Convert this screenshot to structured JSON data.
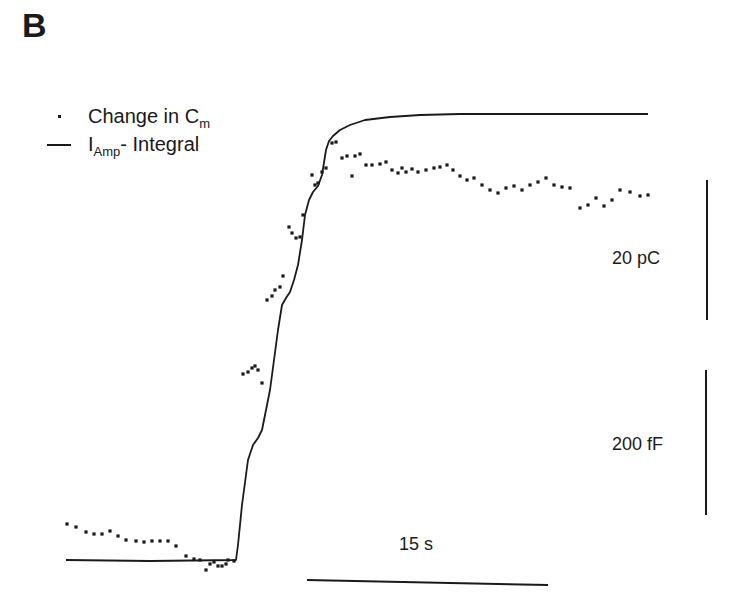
{
  "panel_label": "B",
  "legend": {
    "dots_label_main": "Change in C",
    "dots_label_sub": "m",
    "line_label_main": "I",
    "line_label_sub": "Amp",
    "line_label_rest": "- Integral"
  },
  "scale_bars": {
    "charge": "20 pC",
    "capacitance": "200 fF",
    "time": "15 s"
  },
  "colors": {
    "ink": "#1a1a1a",
    "background": "#ffffff"
  },
  "chart_data": {
    "type": "scatter",
    "title": "",
    "xlabel": "",
    "ylabel": "",
    "grid": false,
    "legend_position": "top-left",
    "annotations": [
      "20 pC (vertical scale bar)",
      "200 fF (vertical scale bar)",
      "15 s (horizontal scale bar)"
    ],
    "series": [
      {
        "name": "I_Amp- Integral",
        "style": "line",
        "pixel_points": [
          [
            66,
            560
          ],
          [
            150,
            561
          ],
          [
            236,
            560
          ],
          [
            238,
            545
          ],
          [
            242,
            505
          ],
          [
            248,
            460
          ],
          [
            253,
            445
          ],
          [
            258,
            438
          ],
          [
            262,
            430
          ],
          [
            266,
            410
          ],
          [
            270,
            390
          ],
          [
            274,
            360
          ],
          [
            278,
            330
          ],
          [
            282,
            305
          ],
          [
            286,
            298
          ],
          [
            290,
            292
          ],
          [
            294,
            280
          ],
          [
            298,
            265
          ],
          [
            302,
            240
          ],
          [
            305,
            215
          ],
          [
            309,
            200
          ],
          [
            313,
            192
          ],
          [
            318,
            186
          ],
          [
            322,
            175
          ],
          [
            326,
            150
          ],
          [
            329,
            141
          ],
          [
            333,
            136
          ],
          [
            340,
            130
          ],
          [
            350,
            125
          ],
          [
            365,
            120
          ],
          [
            390,
            117
          ],
          [
            420,
            115
          ],
          [
            460,
            114
          ],
          [
            648,
            114
          ]
        ]
      },
      {
        "name": "Change in C_m",
        "style": "dots",
        "pixel_points": [
          [
            67,
            524
          ],
          [
            76,
            527
          ],
          [
            86,
            532
          ],
          [
            94,
            534
          ],
          [
            102,
            534
          ],
          [
            110,
            531
          ],
          [
            118,
            536
          ],
          [
            126,
            540
          ],
          [
            136,
            541
          ],
          [
            144,
            542
          ],
          [
            152,
            541
          ],
          [
            160,
            541
          ],
          [
            168,
            541
          ],
          [
            176,
            546
          ],
          [
            186,
            556
          ],
          [
            194,
            559
          ],
          [
            200,
            560
          ],
          [
            206,
            570
          ],
          [
            210,
            564
          ],
          [
            214,
            562
          ],
          [
            218,
            566
          ],
          [
            222,
            566
          ],
          [
            226,
            564
          ],
          [
            228,
            560
          ],
          [
            234,
            561
          ],
          [
            243,
            374
          ],
          [
            248,
            372
          ],
          [
            252,
            368
          ],
          [
            255,
            366
          ],
          [
            258,
            370
          ],
          [
            262,
            383
          ],
          [
            267,
            300
          ],
          [
            272,
            296
          ],
          [
            275,
            290
          ],
          [
            280,
            287
          ],
          [
            283,
            276
          ],
          [
            289,
            227
          ],
          [
            292,
            233
          ],
          [
            296,
            238
          ],
          [
            300,
            237
          ],
          [
            303,
            215
          ],
          [
            312,
            175
          ],
          [
            315,
            185
          ],
          [
            318,
            183
          ],
          [
            322,
            172
          ],
          [
            326,
            168
          ],
          [
            332,
            143
          ],
          [
            336,
            142
          ],
          [
            342,
            158
          ],
          [
            347,
            156
          ],
          [
            352,
            176
          ],
          [
            355,
            156
          ],
          [
            360,
            154
          ],
          [
            366,
            165
          ],
          [
            372,
            165
          ],
          [
            380,
            164
          ],
          [
            386,
            162
          ],
          [
            392,
            170
          ],
          [
            398,
            173
          ],
          [
            402,
            168
          ],
          [
            406,
            172
          ],
          [
            412,
            169
          ],
          [
            418,
            172
          ],
          [
            426,
            170
          ],
          [
            434,
            168
          ],
          [
            440,
            167
          ],
          [
            447,
            165
          ],
          [
            453,
            170
          ],
          [
            460,
            176
          ],
          [
            467,
            180
          ],
          [
            474,
            178
          ],
          [
            482,
            185
          ],
          [
            490,
            190
          ],
          [
            498,
            193
          ],
          [
            506,
            188
          ],
          [
            514,
            186
          ],
          [
            522,
            190
          ],
          [
            530,
            185
          ],
          [
            538,
            182
          ],
          [
            546,
            178
          ],
          [
            554,
            185
          ],
          [
            562,
            187
          ],
          [
            570,
            188
          ],
          [
            580,
            208
          ],
          [
            588,
            205
          ],
          [
            596,
            198
          ],
          [
            604,
            206
          ],
          [
            612,
            200
          ],
          [
            620,
            190
          ],
          [
            630,
            192
          ],
          [
            640,
            196
          ],
          [
            648,
            195
          ]
        ]
      }
    ]
  }
}
